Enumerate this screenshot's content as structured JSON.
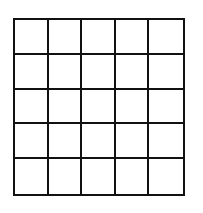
{
  "grid": {
    "rows": 5,
    "columns": 5,
    "line_color": "#111111",
    "background": "#ffffff",
    "cells": [
      [
        "",
        "",
        "",
        "",
        ""
      ],
      [
        "",
        "",
        "",
        "",
        ""
      ],
      [
        "",
        "",
        "",
        "",
        ""
      ],
      [
        "",
        "",
        "",
        "",
        ""
      ],
      [
        "",
        "",
        "",
        "",
        ""
      ]
    ]
  }
}
